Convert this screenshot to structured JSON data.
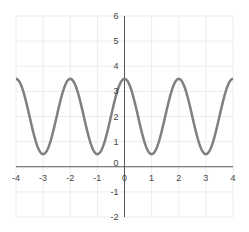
{
  "chart_data": {
    "type": "line",
    "title": "",
    "xlabel": "",
    "ylabel": "",
    "function": "y = 2 + 1.5*cos(pi*x)",
    "xlim": [
      -4,
      4
    ],
    "ylim": [
      -2,
      6
    ],
    "grid": true,
    "legend": null,
    "x_ticks": [
      -4,
      -3,
      -2,
      -1,
      0,
      1,
      2,
      3,
      4
    ],
    "y_ticks": [
      -2,
      -1,
      0,
      1,
      2,
      3,
      4,
      5,
      6
    ],
    "x_tick_labels": [
      "-4",
      "-3",
      "-2",
      "-1",
      "0",
      "1",
      "2",
      "3",
      "4"
    ],
    "y_tick_labels": [
      "-2",
      "-1",
      "0",
      "1",
      "2",
      "3",
      "4",
      "5",
      "6"
    ],
    "series": [
      {
        "name": "curve",
        "color": "#808080",
        "x": [
          -4,
          -3.5,
          -3,
          -2.5,
          -2,
          -1.5,
          -1,
          -0.5,
          0,
          0.5,
          1,
          1.5,
          2,
          2.5,
          3,
          3.5,
          4
        ],
        "values": [
          3.5,
          2,
          0.5,
          2,
          3.5,
          2,
          0.5,
          2,
          3.5,
          2,
          0.5,
          2,
          3.5,
          2,
          0.5,
          2,
          3.5
        ]
      }
    ]
  },
  "colors": {
    "curve": "#808080",
    "axis": "#555555",
    "grid": "#ececec",
    "text": "#444444"
  }
}
